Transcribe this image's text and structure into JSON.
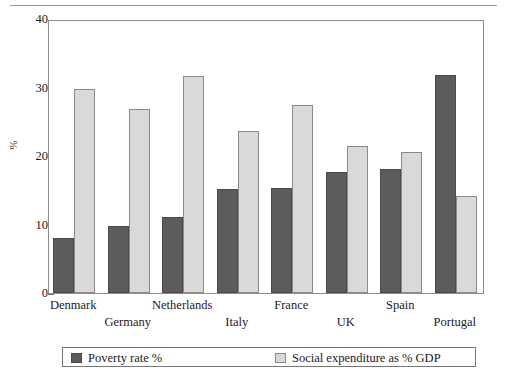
{
  "chart_data": {
    "type": "bar",
    "title": "",
    "xlabel": "",
    "ylabel": "%",
    "ylim": [
      0,
      40
    ],
    "yticks": [
      0,
      10,
      20,
      30,
      40
    ],
    "grid": false,
    "legend_position": "bottom",
    "categories": [
      "Denmark",
      "Germany",
      "Netherlands",
      "Italy",
      "France",
      "UK",
      "Spain",
      "Portugal"
    ],
    "series": [
      {
        "name": "Poverty rate %",
        "color": "#5c5c5c",
        "values": [
          8.1,
          9.8,
          11.1,
          15.2,
          15.3,
          17.7,
          18.1,
          31.8
        ]
      },
      {
        "name": "Social expenditure as % GDP",
        "color": "#d9d9d9",
        "values": [
          29.8,
          26.8,
          31.7,
          23.6,
          27.5,
          21.4,
          20.6,
          14.2
        ]
      }
    ]
  },
  "legend": {
    "entries": [
      {
        "label": "Poverty rate %"
      },
      {
        "label": "Social expenditure as % GDP"
      }
    ]
  },
  "axis": {
    "y_label": "%",
    "y_tick_labels": [
      "40",
      "30",
      "20",
      "10",
      "0"
    ]
  },
  "colors": {
    "series_dark": "#5c5c5c",
    "series_light": "#d9d9d9",
    "frame": "#8d8d8d",
    "rule": "#9a9a9a"
  }
}
